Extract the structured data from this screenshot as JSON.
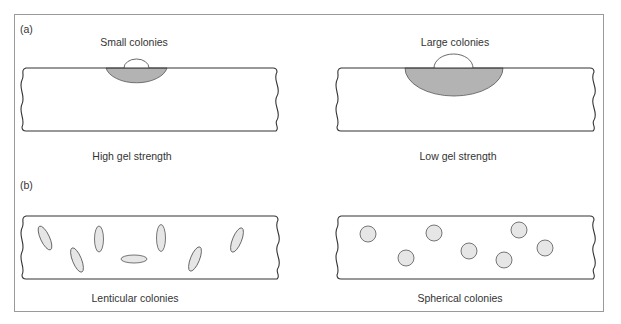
{
  "panel_a": {
    "label": "(a)",
    "left": {
      "title": "Small colonies",
      "caption": "High gel strength"
    },
    "right": {
      "title": "Large colonies",
      "caption": "Low gel strength"
    }
  },
  "panel_b": {
    "label": "(b)",
    "left": {
      "caption": "Lenticular colonies"
    },
    "right": {
      "caption": "Spherical colonies"
    }
  },
  "colors": {
    "frame": "#9a9a9a",
    "outline": "#333333",
    "colony_fill_dark": "#b3b3b3",
    "colony_fill_light": "#e6e6e6",
    "text": "#333333"
  }
}
